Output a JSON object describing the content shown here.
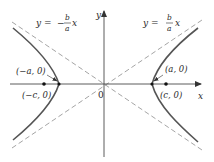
{
  "figure": {
    "type": "hyperbola",
    "equation_form": "x^2/a^2 - y^2/b^2 = 1",
    "colors": {
      "curve": "#555555",
      "asymptote": "#9a9a9a",
      "axis": "#333333",
      "text": "#2a2a2a"
    }
  },
  "axes": {
    "x_label": "x",
    "y_label": "y",
    "origin_label": "0"
  },
  "asymptotes": [
    {
      "id": "positive",
      "label_lhs": "y =",
      "label_num": "b",
      "label_den": "a",
      "label_var": "x",
      "sign": ""
    },
    {
      "id": "negative",
      "label_lhs": "y =",
      "label_num": "b",
      "label_den": "a",
      "label_var": "x",
      "sign": "−"
    }
  ],
  "points": [
    {
      "id": "neg-vertex",
      "label": "(−a, 0)"
    },
    {
      "id": "neg-focus",
      "label": "(−c, 0)"
    },
    {
      "id": "pos-vertex",
      "label": "(a, 0)"
    },
    {
      "id": "pos-focus",
      "label": "(c, 0)"
    }
  ]
}
